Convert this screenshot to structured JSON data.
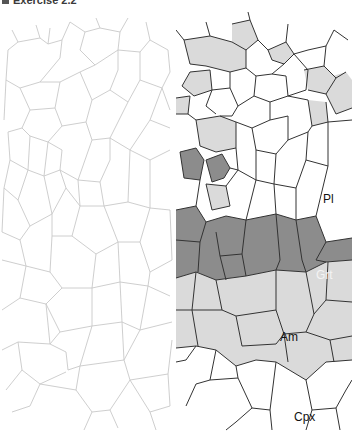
{
  "title": "Exercise 2.2",
  "colors": {
    "plagioclase": "#ffffff",
    "garnet": "#8c8c8c",
    "amphibole": "#dadada",
    "clinopyroxene": "#ffffff",
    "outline_faint": "#c8c8c8",
    "outline_dark": "#333333"
  },
  "panels": {
    "left": {
      "description": "Unlabeled grain boundary sketch (faint outlines)"
    },
    "right": {
      "description": "Interpreted mineral map with shaded phases"
    }
  },
  "labels": [
    {
      "id": "pl",
      "text": "Pl",
      "mineral": "Plagioclase"
    },
    {
      "id": "grt",
      "text": "Grt",
      "mineral": "Garnet"
    },
    {
      "id": "am",
      "text": "Am",
      "mineral": "Amphibole"
    },
    {
      "id": "cpx",
      "text": "Cpx",
      "mineral": "Clinopyroxene"
    }
  ]
}
